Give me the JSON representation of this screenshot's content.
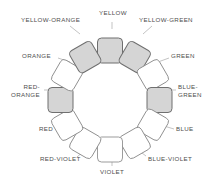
{
  "diagram": {
    "type": "color-wheel",
    "center": {
      "x": 110,
      "y": 100
    },
    "inner_radius": 40,
    "outer_radius": 62,
    "segment_count": 12,
    "colors": {
      "swatch_fill_gray": "#d5d5d5",
      "swatch_fill_white": "#ffffff",
      "swatch_stroke": "#7d7d7d",
      "label_text": "#4e4e4e",
      "background": "#ffffff",
      "leader_line": "#9a9a9a"
    },
    "segments": [
      {
        "label": "YELLOW",
        "angle": 0,
        "filled": true,
        "label_lines": [
          "YELLOW"
        ]
      },
      {
        "label": "YELLOW-GREEN",
        "angle": 30,
        "filled": true,
        "label_lines": [
          "YELLOW-GREEN"
        ]
      },
      {
        "label": "GREEN",
        "angle": 60,
        "filled": false,
        "label_lines": [
          "GREEN"
        ]
      },
      {
        "label": "BLUE-GREEN",
        "angle": 90,
        "filled": true,
        "label_lines": [
          "BLUE-",
          "GREEN"
        ]
      },
      {
        "label": "BLUE",
        "angle": 120,
        "filled": false,
        "label_lines": [
          "BLUE"
        ]
      },
      {
        "label": "BLUE-VIOLET",
        "angle": 150,
        "filled": false,
        "label_lines": [
          "BLUE-VIOLET"
        ]
      },
      {
        "label": "VIOLET",
        "angle": 180,
        "filled": false,
        "label_lines": [
          "VIOLET"
        ]
      },
      {
        "label": "RED-VIOLET",
        "angle": 210,
        "filled": false,
        "label_lines": [
          "RED-VIOLET"
        ]
      },
      {
        "label": "RED",
        "angle": 240,
        "filled": false,
        "label_lines": [
          "RED"
        ]
      },
      {
        "label": "RED-ORANGE",
        "angle": 270,
        "filled": true,
        "label_lines": [
          "RED-",
          "ORANGE"
        ]
      },
      {
        "label": "ORANGE",
        "angle": 300,
        "filled": false,
        "label_lines": [
          "ORANGE"
        ]
      },
      {
        "label": "YELLOW-ORANGE",
        "angle": 330,
        "filled": true,
        "label_lines": [
          "YELLOW-ORANGE"
        ]
      }
    ]
  },
  "labels": {
    "yellow": "YELLOW",
    "yellow_green": "YELLOW-GREEN",
    "green": "GREEN",
    "blue_green_line1": "BLUE-",
    "blue_green_line2": "GREEN",
    "blue": "BLUE",
    "blue_violet": "BLUE-VIOLET",
    "violet": "VIOLET",
    "red_violet": "RED-VIOLET",
    "red": "RED",
    "red_orange_line1": "RED-",
    "red_orange_line2": "ORANGE",
    "orange": "ORANGE",
    "yellow_orange": "YELLOW-ORANGE"
  }
}
